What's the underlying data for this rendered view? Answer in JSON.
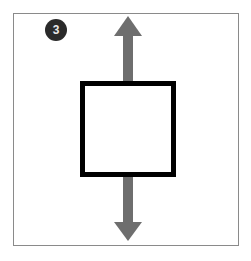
{
  "diagram": {
    "step_badge": {
      "label": "3",
      "color": "#2a2a2a"
    },
    "arrow_color": "#6e6e6e",
    "box_border_color": "#000000",
    "frame_border_color": "#8a8a8a"
  }
}
